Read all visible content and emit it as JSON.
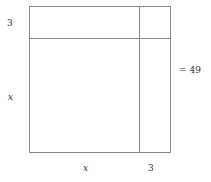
{
  "diagram": {
    "type": "area-model-completing-the-square",
    "left_labels": {
      "top": "3",
      "bottom": "x"
    },
    "bottom_labels": {
      "left": "x",
      "right": "3"
    },
    "equation": "= 49"
  }
}
